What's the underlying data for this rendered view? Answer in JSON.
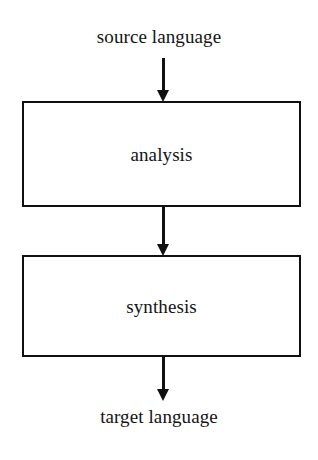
{
  "diagram": {
    "canvas": {
      "width": 318,
      "height": 460,
      "background": "#ffffff"
    },
    "stroke_color": "#101010",
    "text_color": "#141414",
    "terminals": [
      {
        "id": "source-language",
        "label": "source language"
      },
      {
        "id": "target-language",
        "label": "target language"
      }
    ],
    "boxes": [
      {
        "id": "analysis",
        "label": "analysis"
      },
      {
        "id": "synthesis",
        "label": "synthesis"
      }
    ],
    "arrows": [
      {
        "id": "source-to-analysis",
        "from": "source language",
        "to": "analysis",
        "direction": "down"
      },
      {
        "id": "analysis-to-synthesis",
        "from": "analysis",
        "to": "synthesis",
        "direction": "down"
      },
      {
        "id": "synthesis-to-target",
        "from": "synthesis",
        "to": "target language",
        "direction": "down"
      }
    ]
  }
}
